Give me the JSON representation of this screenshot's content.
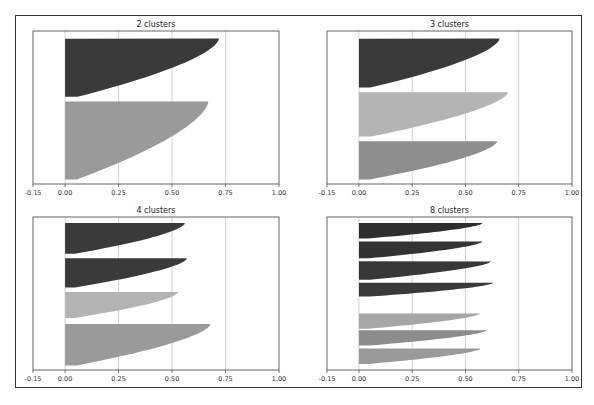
{
  "chart_data": [
    {
      "type": "area",
      "title": "2 clusters",
      "xlabel": "",
      "ylabel": "",
      "xlim": [
        -0.15,
        1.0
      ],
      "xticks": [
        "-0.15",
        "0.00",
        "0.25",
        "0.50",
        "0.75",
        "1.00"
      ],
      "grid": "vertical",
      "clusters": [
        {
          "label": "cluster 1",
          "max_silhouette": 0.72,
          "min_silhouette": 0.0,
          "color": "#3a3a3a"
        },
        {
          "label": "cluster 2",
          "max_silhouette": 0.67,
          "min_silhouette": 0.0,
          "color": "#9a9a9a"
        }
      ]
    },
    {
      "type": "area",
      "title": "3 clusters",
      "xlabel": "",
      "ylabel": "",
      "xlim": [
        -0.15,
        1.0
      ],
      "xticks": [
        "-0.15",
        "0.00",
        "0.25",
        "0.50",
        "0.75",
        "1.00"
      ],
      "grid": "vertical",
      "clusters": [
        {
          "label": "cluster 1",
          "max_silhouette": 0.66,
          "min_silhouette": 0.0,
          "color": "#3a3a3a"
        },
        {
          "label": "cluster 2",
          "max_silhouette": 0.7,
          "min_silhouette": 0.0,
          "color": "#b4b4b4"
        },
        {
          "label": "cluster 3",
          "max_silhouette": 0.65,
          "min_silhouette": 0.0,
          "color": "#8e8e8e"
        }
      ]
    },
    {
      "type": "area",
      "title": "4 clusters",
      "xlabel": "",
      "ylabel": "",
      "xlim": [
        -0.15,
        1.0
      ],
      "xticks": [
        "-0.15",
        "0.00",
        "0.25",
        "0.50",
        "0.75",
        "1.00"
      ],
      "grid": "vertical",
      "clusters": [
        {
          "label": "cluster 1",
          "max_silhouette": 0.56,
          "min_silhouette": -0.02,
          "color": "#3a3a3a"
        },
        {
          "label": "cluster 2",
          "max_silhouette": 0.57,
          "min_silhouette": 0.0,
          "color": "#3a3a3a"
        },
        {
          "label": "cluster 3",
          "max_silhouette": 0.53,
          "min_silhouette": 0.0,
          "color": "#b4b4b4"
        },
        {
          "label": "cluster 4",
          "max_silhouette": 0.68,
          "min_silhouette": -0.01,
          "color": "#9a9a9a"
        }
      ]
    },
    {
      "type": "area",
      "title": "8 clusters",
      "xlabel": "",
      "ylabel": "",
      "xlim": [
        -0.15,
        1.0
      ],
      "xticks": [
        "-0.15",
        "0.00",
        "0.25",
        "0.50",
        "0.75",
        "1.00"
      ],
      "grid": "vertical",
      "clusters": [
        {
          "label": "cluster 1",
          "max_silhouette": 0.58,
          "min_silhouette": 0.0,
          "color": "#2e2e2e"
        },
        {
          "label": "cluster 2",
          "max_silhouette": 0.58,
          "min_silhouette": -0.02,
          "color": "#333333"
        },
        {
          "label": "cluster 3",
          "max_silhouette": 0.62,
          "min_silhouette": 0.0,
          "color": "#383838"
        },
        {
          "label": "cluster 4",
          "max_silhouette": 0.63,
          "min_silhouette": 0.0,
          "color": "#3a3a3a"
        },
        {
          "label": "cluster 5",
          "max_silhouette": 0.57,
          "min_silhouette": 0.0,
          "color": "#a6a6a6"
        },
        {
          "label": "cluster 6",
          "max_silhouette": 0.6,
          "min_silhouette": -0.04,
          "color": "#8c8c8c"
        },
        {
          "label": "cluster 7",
          "max_silhouette": 0.57,
          "min_silhouette": -0.01,
          "color": "#9a9a9a"
        }
      ]
    }
  ]
}
